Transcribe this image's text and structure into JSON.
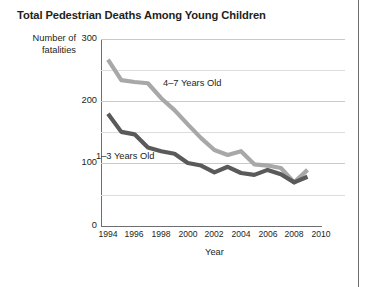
{
  "chart_data": {
    "type": "line",
    "title": "Total Pedestrian Deaths Among Young Children",
    "xlabel": "Year",
    "ylabel": "Number of fatalities",
    "xlim": [
      1993,
      2010.5
    ],
    "ylim": [
      0,
      300
    ],
    "xticks": [
      1994,
      1996,
      1998,
      2000,
      2002,
      2004,
      2006,
      2008,
      2010
    ],
    "yticks": [
      0,
      100,
      200,
      300
    ],
    "minor_yticks": [
      50,
      150,
      250
    ],
    "grid": "horizontal",
    "legend": "inline-annotation",
    "x": [
      1994,
      1995,
      1996,
      1997,
      1998,
      1999,
      2000,
      2001,
      2002,
      2003,
      2004,
      2005,
      2006,
      2007,
      2008,
      2009
    ],
    "series": [
      {
        "name": "4–7 Years Old",
        "color": "#a8a8a8",
        "values": [
          267,
          234,
          231,
          229,
          205,
          186,
          163,
          141,
          122,
          114,
          120,
          99,
          97,
          93,
          70,
          90
        ]
      },
      {
        "name": "1–3 Years Old",
        "color": "#5a5a5a",
        "values": [
          180,
          151,
          147,
          126,
          120,
          116,
          101,
          97,
          86,
          95,
          85,
          82,
          90,
          83,
          70,
          79
        ]
      }
    ]
  },
  "chart": {
    "title": "Total Pedestrian Deaths Among Young Children",
    "y_axis_title": "Number of fatalities",
    "x_axis_title": "Year",
    "y_tick_labels": [
      "300",
      "200",
      "100",
      "0"
    ],
    "x_tick_labels": [
      "1994",
      "1996",
      "1998",
      "2000",
      "2002",
      "2004",
      "2006",
      "2008",
      "2010"
    ],
    "series_labels": {
      "older": "4–7 Years Old",
      "younger": "1–3 Years Old"
    },
    "colors": {
      "older_line": "#a8a8a8",
      "younger_line": "#5a5a5a",
      "gridline": "#c9cacc",
      "minor_gridline": "#dcdddf",
      "axis": "#6d6e71",
      "text": "#231f20",
      "background": "#ffffff"
    }
  }
}
